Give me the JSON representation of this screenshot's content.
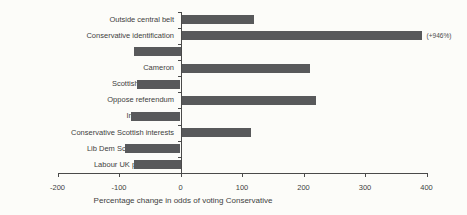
{
  "page": {
    "background_color": "#fcfcf9"
  },
  "chart_data": {
    "type": "bar",
    "orientation": "horizontal",
    "title": "",
    "xlabel": "Percentage change in odds of voting Conservative",
    "ylabel": "",
    "xlim": [
      -200,
      400
    ],
    "xticks": [
      -200,
      -100,
      0,
      100,
      200,
      300,
      400
    ],
    "grid": false,
    "legend": false,
    "bar_color": "#58595b",
    "axis_color": "#4a4a4a",
    "text_color": "#3e3e3e",
    "categories": [
      "Outside central belt",
      "Conservative identification",
      "McConnell",
      "Cameron",
      "Scottish not British",
      "Oppose referendum",
      "Independence",
      "Conservative Scottish interests",
      "Lib Dem Scottish interests",
      "Labour UK performance"
    ],
    "values": [
      120,
      946,
      -75,
      210,
      -70,
      220,
      -80,
      115,
      -90,
      -75
    ],
    "bar_clip": {
      "index": 1,
      "drawn_value": 392,
      "annotation": "(+946%)"
    }
  }
}
